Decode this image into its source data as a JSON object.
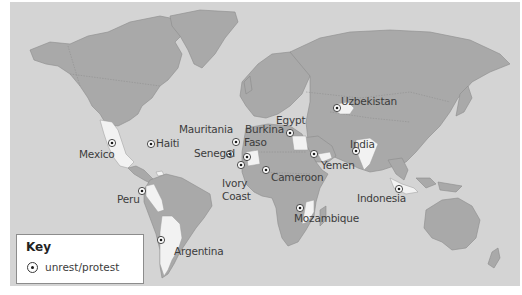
{
  "map": {
    "title": "",
    "colors": {
      "ocean": "#d4d4d4",
      "land": "#a9a9a9",
      "highlighted_country": "#f2f2f2",
      "marker": "#1a1a1a"
    },
    "locations": [
      {
        "name": "Mexico",
        "label": "Mexico",
        "marker": [
          112,
          172
        ],
        "label_pos": [
          78,
          177
        ]
      },
      {
        "name": "Haiti",
        "label": "Haiti",
        "marker": [
          151,
          173
        ],
        "label_pos": [
          158,
          166
        ]
      },
      {
        "name": "Mauritania",
        "label": "Mauritania",
        "marker": [
          237,
          170
        ],
        "label_pos": [
          178,
          180
        ]
      },
      {
        "name": "Burkina Faso",
        "label": "Burkina\nFaso",
        "marker": [
          274,
          186
        ],
        "label_pos": [
          246,
          178
        ]
      },
      {
        "name": "Senegal",
        "label": "Senegal",
        "marker": [
          258,
          184
        ],
        "label_pos": [
          205,
          201
        ]
      },
      {
        "name": "Ivory Coast",
        "label": "Ivory\nCoast",
        "marker": [
          269,
          194
        ],
        "label_pos": [
          222,
          222
        ]
      },
      {
        "name": "Egypt",
        "label": "Egypt",
        "marker": [
          290,
          158
        ],
        "label_pos": [
          276,
          147
        ]
      },
      {
        "name": "Cameroon",
        "label": "Cameroon",
        "marker": [
          267,
          171
        ],
        "label_pos": [
          272,
          173
        ]
      },
      {
        "name": "Uzbekistan",
        "label": "Uzbekistan",
        "marker": [
          336,
          108
        ],
        "label_pos": [
          342,
          97
        ]
      },
      {
        "name": "India",
        "label": "India",
        "marker": [
          356,
          151
        ],
        "label_pos": [
          350,
          143
        ]
      },
      {
        "name": "Yemen",
        "label": "Yemen",
        "marker": [
          315,
          153
        ],
        "label_pos": [
          322,
          158
        ]
      },
      {
        "name": "Mozambique",
        "label": "Mozambique",
        "marker": [
          300,
          207
        ],
        "label_pos": [
          294,
          214
        ]
      },
      {
        "name": "Indonesia",
        "label": "Indonesia",
        "marker": [
          400,
          188
        ],
        "label_pos": [
          357,
          194
        ]
      },
      {
        "name": "Peru",
        "label": "Peru",
        "marker": [
          142,
          191
        ],
        "label_pos": [
          117,
          193
        ]
      },
      {
        "name": "Argentina",
        "label": "Argentina",
        "marker": [
          161,
          240
        ],
        "label_pos": [
          174,
          246
        ]
      }
    ]
  },
  "labels": {
    "mexico": "Mexico",
    "haiti": "Haiti",
    "mauritania": "Mauritania",
    "burkina": "Burkina",
    "faso": "Faso",
    "senegal": "Senegal",
    "ivory": "Ivory",
    "coast": "Coast",
    "egypt": "Egypt",
    "cameroon": "Cameroon",
    "uzbekistan": "Uzbekistan",
    "india": "India",
    "yemen": "Yemen",
    "mozambique": "Mozambique",
    "indonesia": "Indonesia",
    "peru": "Peru",
    "argentina": "Argentina"
  },
  "key": {
    "title": "Key",
    "items": [
      {
        "icon": "circled-dot-marker",
        "label": "unrest/protest"
      }
    ]
  }
}
